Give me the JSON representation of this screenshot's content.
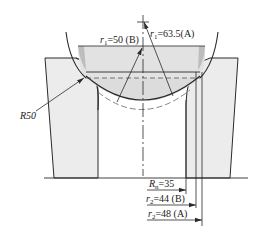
{
  "diagram": {
    "type": "technical-cross-section",
    "colors": {
      "line": "#2a2a2a",
      "fill_light": "#ededed",
      "fill_mid": "#d8d8d8",
      "fill_dark": "#bdbdbd",
      "dash": "#555555",
      "background": "#ffffff"
    },
    "labels": {
      "r1_b": {
        "sym": "r",
        "sub": "1",
        "text": "=50 (B)"
      },
      "r1_a": {
        "sym": "r",
        "sub": "1",
        "text": "=63.5(A)"
      },
      "r50": "R50",
      "rn": {
        "sym": "R",
        "sub": "n",
        "text": "=35"
      },
      "r2_b": {
        "sym": "r",
        "sub": "2",
        "text": "=44 (B)"
      },
      "r2_a": {
        "sym": "r",
        "sub": "2",
        "text": "=48 (A)"
      }
    },
    "dimensions": [
      {
        "name": "Rn",
        "value": 35
      },
      {
        "name": "r2 (B)",
        "value": 44
      },
      {
        "name": "r2 (A)",
        "value": 48
      },
      {
        "name": "r1 (B)",
        "value": 50
      },
      {
        "name": "r1 (A)",
        "value": 63.5
      },
      {
        "name": "R",
        "value": 50
      }
    ]
  }
}
